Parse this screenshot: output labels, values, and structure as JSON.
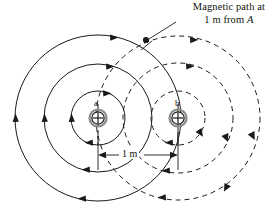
{
  "figure": {
    "title_callout": {
      "line1": "Magnetic path at",
      "line2_prefix": "1 m from ",
      "line2_italic": "A"
    },
    "conductors": [
      {
        "id": "a",
        "label": "a",
        "cx": 98,
        "cy": 118,
        "symbol": "circle-plus"
      },
      {
        "id": "b",
        "label": "b",
        "cx": 178,
        "cy": 118,
        "symbol": "circle-plus"
      }
    ],
    "dimension": {
      "label": "1 m",
      "from_x": 98,
      "to_x": 178,
      "y": 155
    },
    "field_lines_a": {
      "style": "solid",
      "direction": "clockwise",
      "radii": [
        27,
        54,
        83
      ],
      "color": "#1a1a1a"
    },
    "field_lines_b": {
      "style": "dashed",
      "direction": "clockwise",
      "radii": [
        27,
        55,
        82
      ],
      "color": "#1a1a1a"
    },
    "colors": {
      "stroke": "#1a1a1a",
      "background": "#ffffff",
      "symbol_ring": "#7a7a7a"
    }
  }
}
